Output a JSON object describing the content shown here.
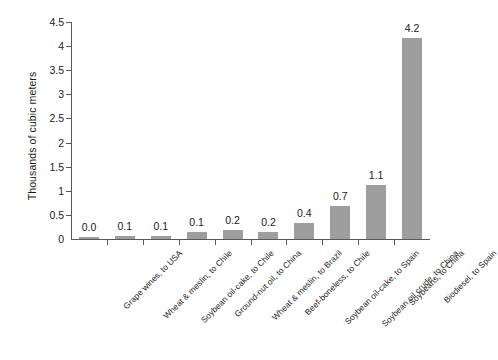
{
  "chart_data": {
    "type": "bar",
    "title": "",
    "subtitle": "",
    "xlabel": "",
    "ylabel": "Thousands of cubic meters",
    "ylim": [
      0,
      4.5
    ],
    "ytick_labels": [
      "0",
      "0.5",
      "1",
      "1.5",
      "2",
      "2.5",
      "3",
      "3.5",
      "4",
      "4.5"
    ],
    "ytick_values": [
      0,
      0.5,
      1,
      1.5,
      2,
      2.5,
      3,
      3.5,
      4,
      4.5
    ],
    "grid": false,
    "legend": false,
    "legend_position": "none",
    "bar_color": "#9e9e9e",
    "axis_color": "#58585a",
    "background_color": "#ffffff",
    "categories": [
      "Grape wines, to USA",
      "Wheat & meslin, to Chile",
      "Soybean oil-cake, to Chile",
      "Ground-nut oil, to China",
      "Wheat &  meslin, to Brazil",
      "Beef-boneless, to Chile",
      "Soybean oil-cake, to Spain",
      "Soybean oil crude, to China",
      "Soybeans, to China",
      "Biodiesel, to Spain"
    ],
    "values": [
      0.03,
      0.06,
      0.07,
      0.14,
      0.18,
      0.15,
      0.33,
      0.68,
      1.12,
      4.17
    ],
    "data_labels": [
      "0.0",
      "0.1",
      "0.1",
      "0.1",
      "0.2",
      "0.2",
      "0.4",
      "0.7",
      "1.1",
      "4.2"
    ]
  }
}
